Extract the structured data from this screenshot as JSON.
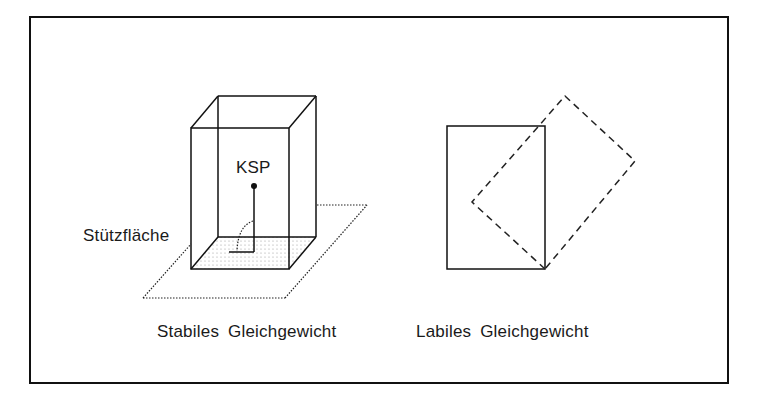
{
  "labels": {
    "center_of_gravity": "KSP",
    "support_area": "Stützfläche",
    "stable_caption": "Stabiles Gleichgewicht",
    "labile_caption": "Labiles Gleichgewicht"
  },
  "colors": {
    "line": "#111111",
    "shading": "#bbbbbb",
    "background": "#ffffff"
  }
}
